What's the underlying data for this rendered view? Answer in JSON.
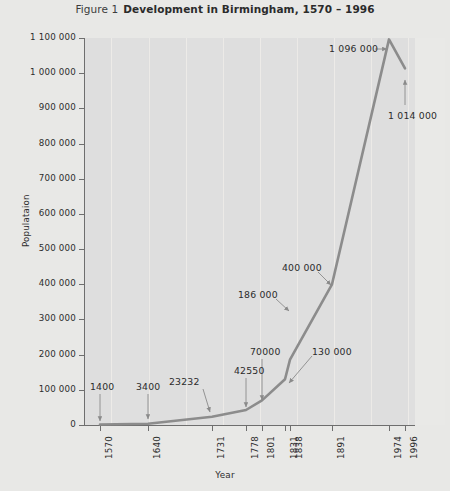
{
  "figure": {
    "prefix": "Figure 1",
    "title": "Development in Birmingham, 1570 – 1996"
  },
  "chart_data": {
    "type": "line",
    "title": "Development in Birmingham, 1570 – 1996",
    "xlabel": "Year",
    "ylabel": "Populataion",
    "categories": [
      "1570",
      "1640",
      "1731",
      "1778",
      "1801",
      "1831",
      "1838",
      "1891",
      "1974",
      "1996"
    ],
    "values": [
      1400,
      3400,
      23232,
      42550,
      70000,
      130000,
      186000,
      400000,
      1096000,
      1014000
    ],
    "point_labels": [
      "1400",
      "3400",
      "23232",
      "42550",
      "70000",
      "130000",
      "186000",
      "400000",
      "1096000",
      "1014000"
    ],
    "ylim": [
      0,
      1100000
    ],
    "ytick_values": [
      0,
      100000,
      200000,
      300000,
      400000,
      500000,
      600000,
      700000,
      800000,
      900000,
      1000000,
      1100000
    ],
    "ytick_labels": [
      "0",
      "100 000",
      "200 000",
      "300 000",
      "400 000",
      "500 000",
      "600 000",
      "700 000",
      "800 000",
      "900 000",
      "1 000 000",
      "1 100 000"
    ],
    "grid": "vertical",
    "legend": "none",
    "series_color": "#8c8c8c",
    "plot_background": "#dedede",
    "page_background": "#e8e8e6"
  }
}
